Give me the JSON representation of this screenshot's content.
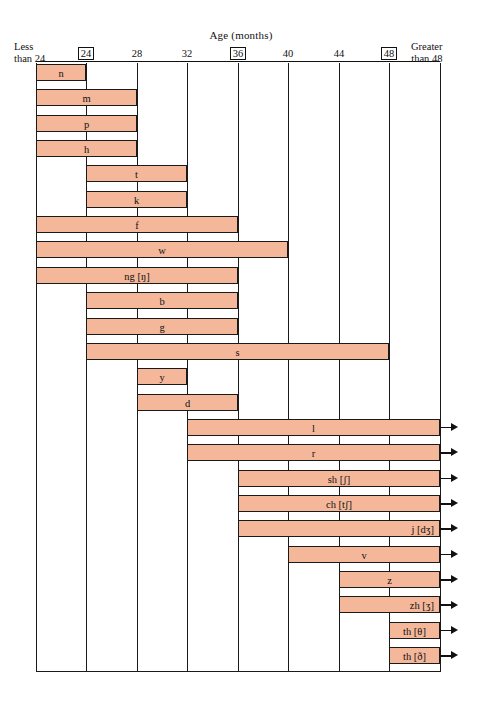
{
  "chart_data": {
    "type": "bar",
    "title": "Age (months)",
    "xlabel": "Age (months)",
    "ylabel": "",
    "orientation": "horizontal",
    "grid": true,
    "legend": null,
    "axis": {
      "left_edge_label": "Less\nthan 24",
      "right_edge_label": "Greater\nthan 48",
      "left_edge_line1": "Less",
      "left_edge_line2": "than 24",
      "right_edge_line1": "Greater",
      "right_edge_line2": "than 48",
      "ticks": [
        {
          "label": "24",
          "boxed": true,
          "x": 86
        },
        {
          "label": "28",
          "boxed": false,
          "x": 137
        },
        {
          "label": "32",
          "boxed": false,
          "x": 187
        },
        {
          "label": "36",
          "boxed": true,
          "x": 238
        },
        {
          "label": "40",
          "boxed": false,
          "x": 288
        },
        {
          "label": "44",
          "boxed": false,
          "x": 339
        },
        {
          "label": "48",
          "boxed": true,
          "x": 389
        }
      ],
      "gridline_x": [
        0,
        50,
        101,
        151,
        202,
        252,
        303,
        353,
        404
      ],
      "range_min": 20,
      "range_max": 52,
      "tick_values": [
        24,
        28,
        32,
        36,
        40,
        44,
        48
      ]
    },
    "colors": {
      "bar_fill": "#f4b79a",
      "bar_stroke": "#1a1a1a",
      "grid": "#1a1a1a",
      "background": "#ffffff",
      "text": "#111111"
    },
    "categories": [
      "n",
      "m",
      "p",
      "h",
      "t",
      "k",
      "f",
      "w",
      "ng [ŋ]",
      "b",
      "g",
      "s",
      "y",
      "d",
      "l",
      "r",
      "sh [ʃ]",
      "ch [tʃ]",
      "j [dʒ]",
      "v",
      "z",
      "zh [ʒ]",
      "th [θ]",
      "th [ð]"
    ],
    "bars": [
      {
        "label": "n",
        "start": 20,
        "end": 24,
        "start_px": 0,
        "end_px": 50,
        "arrow": false,
        "label_align": "center"
      },
      {
        "label": "m",
        "start": 20,
        "end": 28,
        "start_px": 0,
        "end_px": 101,
        "arrow": false,
        "label_align": "center"
      },
      {
        "label": "p",
        "start": 20,
        "end": 28,
        "start_px": 0,
        "end_px": 101,
        "arrow": false,
        "label_align": "center"
      },
      {
        "label": "h",
        "start": 20,
        "end": 28,
        "start_px": 0,
        "end_px": 101,
        "arrow": false,
        "label_align": "center"
      },
      {
        "label": "t",
        "start": 24,
        "end": 32,
        "start_px": 50,
        "end_px": 151,
        "arrow": false,
        "label_align": "center"
      },
      {
        "label": "k",
        "start": 24,
        "end": 32,
        "start_px": 50,
        "end_px": 151,
        "arrow": false,
        "label_align": "center"
      },
      {
        "label": "f",
        "start": 20,
        "end": 36,
        "start_px": 0,
        "end_px": 202,
        "arrow": false,
        "label_align": "center"
      },
      {
        "label": "w",
        "start": 20,
        "end": 40,
        "start_px": 0,
        "end_px": 252,
        "arrow": false,
        "label_align": "center"
      },
      {
        "label": "ng [ŋ]",
        "start": 20,
        "end": 36,
        "start_px": 0,
        "end_px": 202,
        "arrow": false,
        "label_align": "center"
      },
      {
        "label": "b",
        "start": 24,
        "end": 36,
        "start_px": 50,
        "end_px": 202,
        "arrow": false,
        "label_align": "center"
      },
      {
        "label": "g",
        "start": 24,
        "end": 36,
        "start_px": 50,
        "end_px": 202,
        "arrow": false,
        "label_align": "center"
      },
      {
        "label": "s",
        "start": 24,
        "end": 48,
        "start_px": 50,
        "end_px": 353,
        "arrow": false,
        "label_align": "center"
      },
      {
        "label": "y",
        "start": 28,
        "end": 32,
        "start_px": 101,
        "end_px": 151,
        "arrow": false,
        "label_align": "center"
      },
      {
        "label": "d",
        "start": 28,
        "end": 36,
        "start_px": 101,
        "end_px": 202,
        "arrow": false,
        "label_align": "center"
      },
      {
        "label": "l",
        "start": 32,
        "end": 52,
        "start_px": 151,
        "end_px": 404,
        "arrow": true,
        "label_align": "center"
      },
      {
        "label": "r",
        "start": 32,
        "end": 52,
        "start_px": 151,
        "end_px": 404,
        "arrow": true,
        "label_align": "center"
      },
      {
        "label": "sh [ʃ]",
        "start": 36,
        "end": 52,
        "start_px": 202,
        "end_px": 404,
        "arrow": true,
        "label_align": "center"
      },
      {
        "label": "ch [tʃ]",
        "start": 36,
        "end": 52,
        "start_px": 202,
        "end_px": 404,
        "arrow": true,
        "label_align": "center"
      },
      {
        "label": "j [dʒ]",
        "start": 36,
        "end": 52,
        "start_px": 202,
        "end_px": 404,
        "arrow": true,
        "label_align": "right"
      },
      {
        "label": "v",
        "start": 40,
        "end": 52,
        "start_px": 252,
        "end_px": 404,
        "arrow": true,
        "label_align": "center"
      },
      {
        "label": "z",
        "start": 44,
        "end": 52,
        "start_px": 303,
        "end_px": 404,
        "arrow": true,
        "label_align": "center"
      },
      {
        "label": "zh [ʒ]",
        "start": 44,
        "end": 52,
        "start_px": 303,
        "end_px": 404,
        "arrow": true,
        "label_align": "right"
      },
      {
        "label": "th [θ]",
        "start": 48,
        "end": 52,
        "start_px": 353,
        "end_px": 404,
        "arrow": true,
        "label_align": "center"
      },
      {
        "label": "th [ð]",
        "start": 48,
        "end": 52,
        "start_px": 353,
        "end_px": 404,
        "arrow": true,
        "label_align": "center"
      }
    ]
  }
}
